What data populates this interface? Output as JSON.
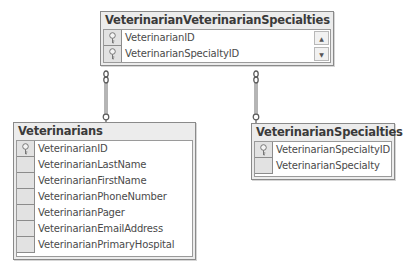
{
  "diagram": {
    "tables": [
      {
        "id": "junction",
        "title": "VeterinarianVeterinarianSpecialties",
        "columns": [
          {
            "name": "VeterinarianID",
            "key": true
          },
          {
            "name": "VeterinarianSpecialtyID",
            "key": true
          }
        ],
        "scroll_up_glyph": "▲",
        "scroll_down_glyph": "▼"
      },
      {
        "id": "veterinarians",
        "title": "Veterinarians",
        "columns": [
          {
            "name": "VeterinarianID",
            "key": true
          },
          {
            "name": "VeterinarianLastName",
            "key": false
          },
          {
            "name": "VeterinarianFirstName",
            "key": false
          },
          {
            "name": "VeterinarianPhoneNumber",
            "key": false
          },
          {
            "name": "VeterinarianPager",
            "key": false
          },
          {
            "name": "VeterinarianEmailAddress",
            "key": false
          },
          {
            "name": "VeterinarianPrimaryHospital",
            "key": false
          }
        ]
      },
      {
        "id": "specialties",
        "title": "VeterinarianSpecialties",
        "columns": [
          {
            "name": "VeterinarianSpecialtyID",
            "key": true
          },
          {
            "name": "VeterinarianSpecialty",
            "key": false
          }
        ]
      }
    ],
    "relationships": [
      {
        "from": "VeterinarianVeterinarianSpecialties",
        "to": "Veterinarians",
        "type": "many-to-one"
      },
      {
        "from": "VeterinarianVeterinarianSpecialties",
        "to": "VeterinarianSpecialties",
        "type": "many-to-one"
      }
    ],
    "colors": {
      "table_bg": "#ececec",
      "border": "#8a8a8a",
      "connector": "#5a5a5a"
    }
  }
}
